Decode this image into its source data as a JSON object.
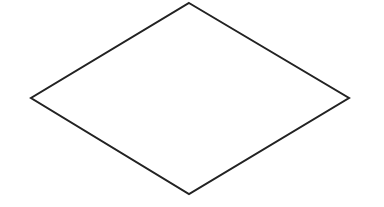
{
  "diagram": {
    "shape": "diamond",
    "vertices": {
      "top": [
        189,
        3
      ],
      "right": [
        349,
        98
      ],
      "bottom": [
        189,
        194
      ],
      "left": [
        31,
        98
      ]
    },
    "stroke_color": "#222222",
    "stroke_width": 2,
    "fill_color": "#ffffff",
    "label": ""
  }
}
